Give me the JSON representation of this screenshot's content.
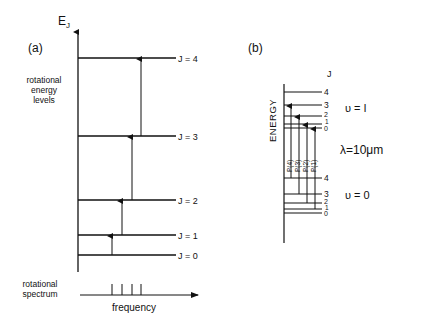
{
  "panel_a": {
    "label": "(a)",
    "axis_label_main": "E",
    "axis_label_sub": "J",
    "levels_caption": [
      "rotational",
      "energy",
      "levels"
    ],
    "levels": [
      {
        "label": "J = 4"
      },
      {
        "label": "J = 3"
      },
      {
        "label": "J = 2"
      },
      {
        "label": "J = 1"
      },
      {
        "label": "J = 0"
      }
    ],
    "spectrum_caption": [
      "rotational",
      "spectrum"
    ],
    "spectrum_axis_label": "frequency"
  },
  "panel_b": {
    "label": "(b)",
    "energy_label": "ENERGY",
    "j_header": "J",
    "upper_state": "υ = I",
    "lower_state": "υ = 0",
    "wavelength": "λ=10μm",
    "upper_levels": [
      "4",
      "3",
      "2",
      "1",
      "0"
    ],
    "lower_levels": [
      "4",
      "3",
      "2",
      "1",
      "0"
    ],
    "p_lines": [
      "P(4)",
      "P(3)",
      "P(2)",
      "P(1)"
    ],
    "r_lines": [
      "R(0)",
      "R(1)",
      "R(2)",
      "R(3)"
    ],
    "delta_left": "ΔJ=-1",
    "delta_right": "ΔJ=-1",
    "p_branch": "P-BRANCH",
    "r_branch": "R-BRANCH",
    "center_label": "ν",
    "center_sub": "0"
  }
}
